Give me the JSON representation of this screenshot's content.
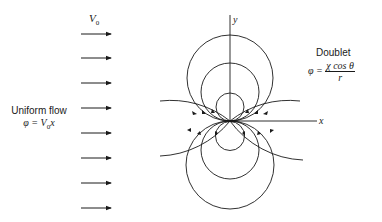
{
  "diagram": {
    "uniform_flow": {
      "velocity_label": "V",
      "velocity_subscript": "0",
      "title": "Uniform flow",
      "equation_lhs": "φ = ",
      "equation_rhs_var": "V",
      "equation_rhs_sub": "0",
      "equation_rhs_tail": "x",
      "arrow_count": 8
    },
    "doublet": {
      "title": "Doublet",
      "equation_lhs": "φ = ",
      "numerator": "χ cos θ",
      "denominator": "r"
    },
    "axes": {
      "x_label": "x",
      "y_label": "y"
    }
  }
}
